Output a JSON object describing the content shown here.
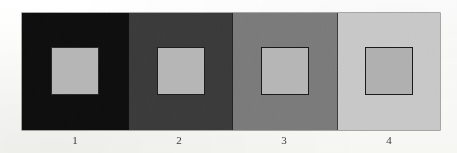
{
  "figure": {
    "type": "simultaneous-contrast-illusion",
    "panel_count": 4,
    "page_background": "#fdfdfb",
    "strip_border_color": "#000000",
    "caption_color": "#3a3a3a",
    "panels": [
      {
        "label": "1",
        "background_color": "#0d0d0d",
        "background_name": "black",
        "square_color": "#b6b6b6",
        "square_border_color": "#2a2a2a"
      },
      {
        "label": "2",
        "background_color": "#3a3a3a",
        "background_name": "dark-gray",
        "square_color": "#b6b6b6",
        "square_border_color": "#1f1f1f"
      },
      {
        "label": "3",
        "background_color": "#7b7b7b",
        "background_name": "medium-gray",
        "square_color": "#b6b6b6",
        "square_border_color": "#1a1a1a"
      },
      {
        "label": "4",
        "background_color": "#c9c9c9",
        "background_name": "light-gray",
        "square_color": "#b0b0b0",
        "square_border_color": "#1a1a1a"
      }
    ]
  }
}
